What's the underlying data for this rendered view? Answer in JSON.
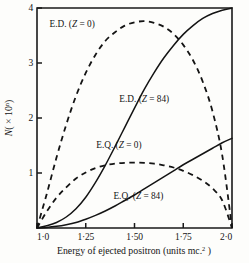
{
  "chart_data": {
    "type": "line",
    "title": "",
    "xlabel": "Energy of ejected positron  (units mc.2)",
    "ylabel": "N( × 10n)",
    "xlim": [
      1.0,
      2.0
    ],
    "ylim": [
      0,
      4
    ],
    "grid": false,
    "legend_position": "inline-annotations",
    "xticks": [
      "1·0",
      "1·25",
      "1·50",
      "1·75",
      "2·0"
    ],
    "xtick_values": [
      1.0,
      1.25,
      1.5,
      1.75,
      2.0
    ],
    "yticks": [
      "1",
      "2",
      "3",
      "4"
    ],
    "ytick_values": [
      1,
      2,
      3,
      4
    ],
    "x": [
      1.0,
      1.05,
      1.1,
      1.15,
      1.2,
      1.25,
      1.3,
      1.35,
      1.4,
      1.45,
      1.5,
      1.55,
      1.6,
      1.65,
      1.7,
      1.75,
      1.8,
      1.85,
      1.9,
      1.95,
      2.0
    ],
    "series": [
      {
        "name": "E.D. (Z = 0)",
        "style": "dashed",
        "label_x": 1.18,
        "label_y": 3.66,
        "values": [
          0.0,
          0.62,
          1.28,
          1.88,
          2.4,
          2.82,
          3.15,
          3.4,
          3.56,
          3.68,
          3.74,
          3.76,
          3.73,
          3.66,
          3.53,
          3.33,
          3.05,
          2.66,
          2.12,
          1.32,
          0.0
        ]
      },
      {
        "name": "E.D. (Z = 84)",
        "style": "solid",
        "label_x": 1.55,
        "label_y": 2.3,
        "values": [
          0.0,
          0.04,
          0.1,
          0.2,
          0.35,
          0.56,
          0.83,
          1.14,
          1.48,
          1.83,
          2.18,
          2.52,
          2.82,
          3.09,
          3.32,
          3.52,
          3.68,
          3.81,
          3.9,
          3.96,
          4.0
        ]
      },
      {
        "name": "E.Q. (Z = 0)",
        "style": "dashed",
        "label_x": 1.42,
        "label_y": 1.45,
        "values": [
          0.0,
          0.3,
          0.55,
          0.74,
          0.9,
          1.01,
          1.09,
          1.14,
          1.17,
          1.185,
          1.19,
          1.185,
          1.17,
          1.14,
          1.1,
          1.04,
          0.96,
          0.86,
          0.72,
          0.5,
          0.0
        ]
      },
      {
        "name": "E.Q. (Z = 84)",
        "style": "solid",
        "label_x": 1.52,
        "label_y": 0.52,
        "values": [
          0.0,
          0.01,
          0.03,
          0.06,
          0.1,
          0.16,
          0.23,
          0.31,
          0.4,
          0.5,
          0.6,
          0.71,
          0.82,
          0.93,
          1.04,
          1.15,
          1.25,
          1.35,
          1.45,
          1.55,
          1.63
        ]
      }
    ]
  }
}
